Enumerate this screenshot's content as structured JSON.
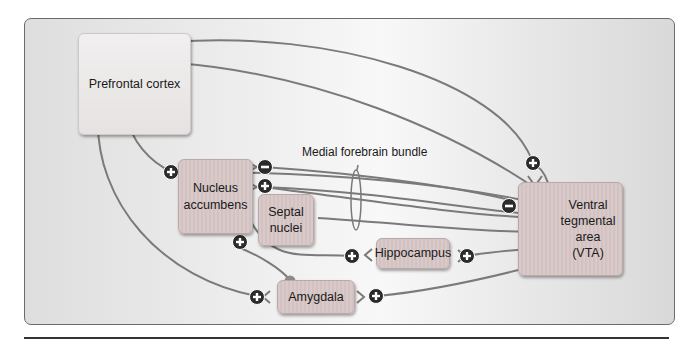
{
  "diagram": {
    "title": "",
    "bundle_label": "Medial forebrain bundle",
    "regions": {
      "prefrontal": "Prefrontal cortex",
      "accumbens_line1": "Nucleus",
      "accumbens_line2": "accumbens",
      "septal_line1": "Septal",
      "septal_line2": "nuclei",
      "hippocampus": "Hippocampus",
      "amygdala": "Amygdala",
      "vta_line1": "Ventral",
      "vta_line2": "tegmental",
      "vta_line3": "area",
      "vta_line4": "(VTA)"
    },
    "signs": {
      "plus": "+",
      "minus": "−"
    },
    "colors": {
      "wire": "#7a7a7a",
      "node": "#8c8c8c",
      "sign_bg": "#2b2b2b",
      "region_fill": "#d6c6c6",
      "panel_border": "#6b6b6b"
    }
  }
}
